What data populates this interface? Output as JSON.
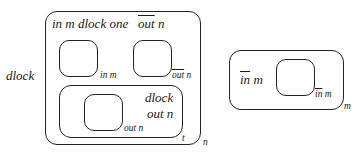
{
  "left_label": "dlock",
  "outer_box": {
    "title_part1": "in m dlock one",
    "title_part2_overlined": "out",
    "title_part2_rest": " n",
    "corner_label": "n",
    "cell_a": {
      "label": "in m"
    },
    "cell_b": {
      "label_overlined": "out",
      "label_rest": " n"
    },
    "inner_box": {
      "line1": "dlock",
      "line2": "out n",
      "cell_label": "out n",
      "corner_label": "t"
    }
  },
  "right_box": {
    "title_overlined": "in",
    "title_rest": " m",
    "cell_label_overlined": "in",
    "cell_label_rest": " m",
    "corner_label": "m"
  }
}
